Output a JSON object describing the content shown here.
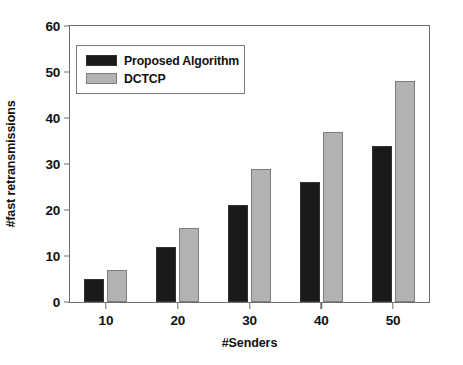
{
  "chart_data": {
    "type": "bar",
    "title": "",
    "subtitle": "",
    "xlabel": "#Senders",
    "ylabel": "#fast retransmissions",
    "categories": [
      "10",
      "20",
      "30",
      "40",
      "50"
    ],
    "series": [
      {
        "name": "Proposed Algorithm",
        "color": "#1a1a1a",
        "values": [
          5,
          12,
          21,
          26,
          34
        ]
      },
      {
        "name": "DCTCP",
        "color": "#b3b3b3",
        "values": [
          7,
          16,
          29,
          37,
          48
        ]
      }
    ],
    "ylim": [
      0,
      60
    ],
    "yticks": [
      "0",
      "10",
      "20",
      "30",
      "40",
      "50",
      "60"
    ],
    "ytick_values": [
      0,
      10,
      20,
      30,
      40,
      50,
      60
    ],
    "xticks": [
      "10",
      "20",
      "30",
      "40",
      "50"
    ],
    "grid": false,
    "legend_position": "top-left",
    "frame": true,
    "annotations": []
  },
  "legend": {
    "entries": [
      {
        "label": "Proposed Algorithm"
      },
      {
        "label": "DCTCP"
      }
    ]
  }
}
